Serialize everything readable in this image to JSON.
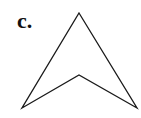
{
  "figure": {
    "label": "c.",
    "shape": {
      "type": "arrowhead-polygon",
      "points": [
        [
          79,
          13
        ],
        [
          137,
          108
        ],
        [
          79,
          75
        ],
        [
          22,
          108
        ]
      ],
      "stroke": "#1a1a1a",
      "stroke_width": 1.3,
      "fill": "none"
    }
  }
}
